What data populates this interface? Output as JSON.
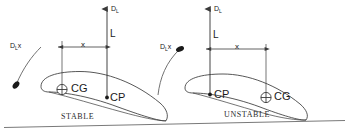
{
  "diagram": {
    "stroke_color": "#3a3a3a",
    "text_color": "#1a1a1a",
    "background": "#ffffff"
  },
  "panels": [
    {
      "id": "stable",
      "caption": "STABLE",
      "moment_label": {
        "base": "D",
        "sub": "L",
        "factor": "x"
      },
      "lift_arrow_label": {
        "base": "D",
        "sub": "L"
      },
      "lift_label": "L",
      "distance_label": "x",
      "points": [
        {
          "name": "CG",
          "label": "CG",
          "marker": "circle-cross"
        },
        {
          "name": "CP",
          "label": "CP",
          "marker": "dot"
        }
      ],
      "order_note": "CG forward of CP"
    },
    {
      "id": "unstable",
      "caption": "UNSTABLE",
      "moment_label": {
        "base": "D",
        "sub": "L",
        "factor": "x"
      },
      "lift_arrow_label": {
        "base": "D",
        "sub": "L"
      },
      "lift_label": "L",
      "distance_label": "x",
      "points": [
        {
          "name": "CP",
          "label": "CP",
          "marker": "dot"
        },
        {
          "name": "CG",
          "label": "CG",
          "marker": "circle-cross"
        }
      ],
      "order_note": "CP forward of CG"
    }
  ]
}
